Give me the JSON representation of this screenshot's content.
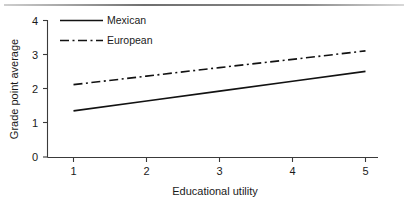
{
  "chart_data": {
    "type": "line",
    "title": "",
    "subtitle": "",
    "xlabel": "Educational utility",
    "ylabel": "Grade point average",
    "x": [
      1,
      2,
      3,
      4,
      5
    ],
    "xticklabels": [
      "1",
      "2",
      "3",
      "4",
      "5"
    ],
    "yticks": [
      0,
      1,
      2,
      3,
      4
    ],
    "yticklabels": [
      "0",
      "1",
      "2",
      "3",
      "4"
    ],
    "xlim": [
      1,
      5
    ],
    "ylim": [
      0,
      4
    ],
    "grid": false,
    "legend_position": "top-left-inside",
    "series": [
      {
        "name": "Mexican",
        "style": "solid",
        "color": "#121212",
        "values": [
          1.35,
          1.64,
          1.93,
          2.22,
          2.51
        ]
      },
      {
        "name": "European",
        "style": "dash-dot",
        "color": "#121212",
        "values": [
          2.12,
          2.37,
          2.62,
          2.86,
          3.11
        ]
      }
    ],
    "legend": [
      {
        "label": "Mexican",
        "style": "solid"
      },
      {
        "label": "European",
        "style": "dash-dot"
      }
    ]
  },
  "figure": {
    "background_color": "#ffffff",
    "axis_color": "#3a3a3a",
    "top_rule_color": "#6f6f6f"
  }
}
